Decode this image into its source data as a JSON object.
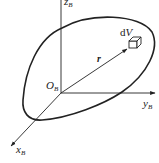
{
  "diagram": {
    "type": "rigid-body-coordinate-frame",
    "axes": {
      "z": {
        "symbol": "z",
        "subscript": "B"
      },
      "y": {
        "symbol": "y",
        "subscript": "B"
      },
      "x": {
        "symbol": "x",
        "subscript": "B"
      }
    },
    "origin": {
      "symbol": "O",
      "subscript": "B"
    },
    "position_vector": {
      "symbol": "r"
    },
    "volume_element": {
      "prefix": "d",
      "symbol": "V"
    },
    "colors": {
      "stroke": "#222222",
      "background": "#ffffff"
    }
  }
}
